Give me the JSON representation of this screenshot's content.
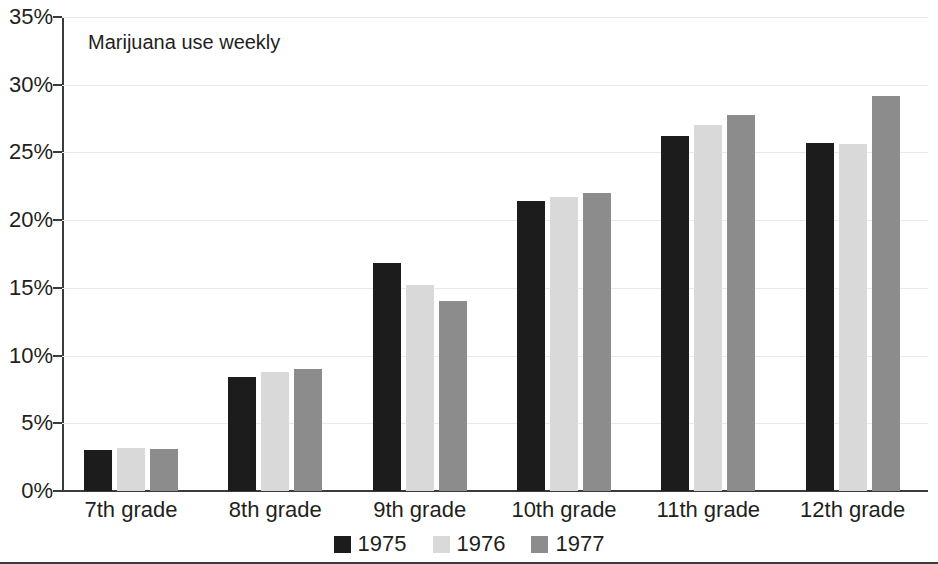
{
  "chart_data": {
    "type": "bar",
    "title": "Marijuana use weekly",
    "xlabel": "",
    "ylabel": "",
    "ylim": [
      0,
      35
    ],
    "ytick_labels": [
      "0%",
      "5%",
      "10%",
      "15%",
      "20%",
      "25%",
      "30%",
      "35%"
    ],
    "ytick_values": [
      0,
      5,
      10,
      15,
      20,
      25,
      30,
      35
    ],
    "grid": true,
    "legend_position": "bottom-center",
    "categories": [
      "7th grade",
      "8th grade",
      "9th grade",
      "10th grade",
      "11th grade",
      "12th grade"
    ],
    "series": [
      {
        "name": "1975",
        "color": "#1c1c1c",
        "values": [
          3.0,
          8.4,
          16.8,
          21.4,
          26.2,
          25.7
        ]
      },
      {
        "name": "1976",
        "color": "#d9d9d9",
        "values": [
          3.2,
          8.8,
          15.2,
          21.7,
          27.0,
          25.6
        ]
      },
      {
        "name": "1977",
        "color": "#8c8c8c",
        "values": [
          3.1,
          9.0,
          14.0,
          22.0,
          27.8,
          29.2
        ]
      }
    ]
  }
}
